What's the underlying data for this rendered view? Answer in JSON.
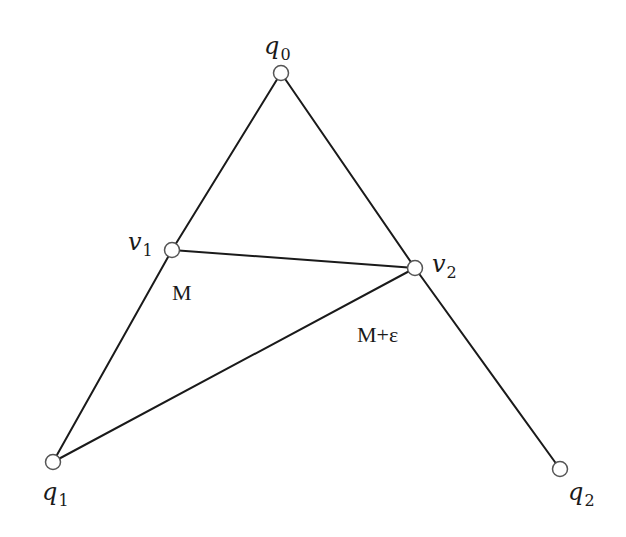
{
  "diagram": {
    "type": "graph",
    "nodes": [
      {
        "id": "q0",
        "base": "q",
        "sub": "0",
        "x": 281,
        "y": 73,
        "label_x": 264,
        "label_y": 54
      },
      {
        "id": "v1",
        "base": "v",
        "sub": "1",
        "x": 172,
        "y": 250,
        "label_x": 128,
        "label_y": 250
      },
      {
        "id": "v2",
        "base": "v",
        "sub": "2",
        "x": 415,
        "y": 268,
        "label_x": 432,
        "label_y": 272
      },
      {
        "id": "q1",
        "base": "q",
        "sub": "1",
        "x": 53,
        "y": 462,
        "label_x": 42,
        "label_y": 500
      },
      {
        "id": "q2",
        "base": "q",
        "sub": "2",
        "x": 560,
        "y": 469,
        "label_x": 568,
        "label_y": 500
      }
    ],
    "edges": [
      {
        "from": "q0",
        "to": "v1"
      },
      {
        "from": "v1",
        "to": "q1"
      },
      {
        "from": "q0",
        "to": "v2"
      },
      {
        "from": "v2",
        "to": "q2"
      },
      {
        "from": "v1",
        "to": "v2"
      },
      {
        "from": "q1",
        "to": "v2"
      }
    ],
    "annotations": [
      {
        "id": "weight-m",
        "text": "M",
        "x": 172,
        "y": 300
      },
      {
        "id": "weight-m-eps",
        "text": "M+ε",
        "x": 357,
        "y": 342
      }
    ]
  }
}
